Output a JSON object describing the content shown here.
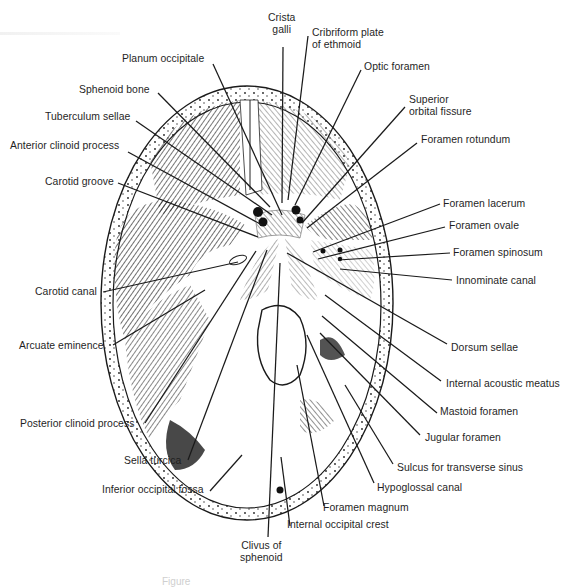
{
  "figure": {
    "caption": "Figure",
    "colors": {
      "ink": "#1a1a1a",
      "background": "#ffffff",
      "bone_fill": "#f7f7f7"
    }
  },
  "labels": {
    "crista_galli": {
      "line1": "Crista",
      "line2": "galli"
    },
    "cribriform_plate": {
      "line1": "Cribriform plate",
      "line2": "of ethmoid"
    },
    "planum_occipitale": "Planum occipitale",
    "optic_foramen": "Optic foramen",
    "sphenoid_bone": "Sphenoid bone",
    "superior_orbital_fissure": {
      "line1": "Superior",
      "line2": "orbital fissure"
    },
    "tuberculum_sellae": "Tuberculum sellae",
    "foramen_rotundum": "Foramen rotundum",
    "anterior_clinoid_process": "Anterior clinoid process",
    "carotid_groove": "Carotid groove",
    "foramen_lacerum": "Foramen lacerum",
    "foramen_ovale": "Foramen ovale",
    "foramen_spinosum": "Foramen spinosum",
    "innominate_canal": "Innominate canal",
    "carotid_canal": "Carotid canal",
    "arcuate_eminence": "Arcuate eminence",
    "dorsum_sellae": "Dorsum sellae",
    "internal_acoustic_meatus": "Internal acoustic meatus",
    "mastoid_foramen": "Mastoid foramen",
    "posterior_clinoid_process": "Posterior clinoid process",
    "jugular_foramen": "Jugular foramen",
    "sella_turcica": "Sella turcica",
    "sulcus_transverse_sinus": "Sulcus for transverse sinus",
    "inferior_occipital_fossa": "Inferior occipital fossa",
    "hypoglossal_canal": "Hypoglossal canal",
    "foramen_magnum": "Foramen magnum",
    "internal_occipital_crest": "Internal occipital crest",
    "clivus_of_sphenoid": {
      "line1": "Clivus of",
      "line2": "sphenoid"
    }
  }
}
